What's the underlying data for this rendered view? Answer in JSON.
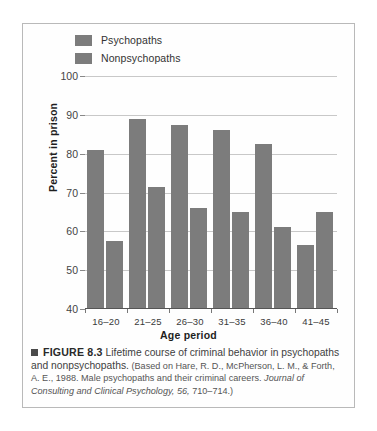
{
  "figure": {
    "bullet_icon": "square-bullet",
    "label": "FIGURE 8.3",
    "title_text": "Lifetime course of criminal behavior in psychopaths and nonpsychopaths.",
    "source_open": "(Based on Hare, R. D., McPherson, L. M., & Forth, A. E., 1988. Male psychopaths and their criminal careers.",
    "source_journal": "Journal of Consulting and Clinical Psychology, 56,",
    "source_pages": "710–714.)"
  },
  "chart_data": {
    "type": "bar",
    "title": "Lifetime course of criminal behavior in psychopaths and nonpsychopaths",
    "xlabel": "Age period",
    "ylabel": "Percent in prison",
    "categories": [
      "16–20",
      "21–25",
      "26–30",
      "31–35",
      "36–40",
      "41–45"
    ],
    "series": [
      {
        "name": "Psychopaths",
        "color": "#7c7c7c",
        "values": [
          81,
          89,
          87.5,
          86,
          82.5,
          56.5
        ]
      },
      {
        "name": "Nonpsychopaths",
        "color": "#7c7c7c",
        "values": [
          57.5,
          71.5,
          66,
          65,
          61,
          65
        ]
      }
    ],
    "ylim": [
      40,
      100
    ],
    "yticks": [
      40,
      50,
      60,
      70,
      80,
      90,
      100
    ],
    "ytick_labels": [
      "40",
      "50",
      "60",
      "70",
      "80",
      "90",
      "100"
    ],
    "grid": "horizontal",
    "legend_position": "top-left"
  }
}
